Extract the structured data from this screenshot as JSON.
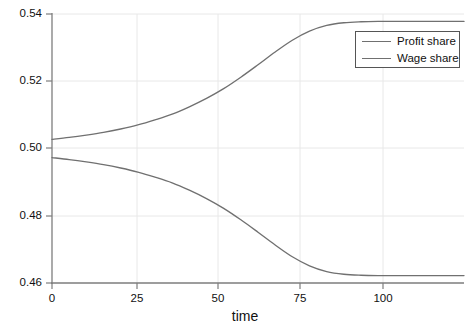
{
  "chart_data": {
    "type": "line",
    "title": "",
    "subtitle": "",
    "xlabel": "time",
    "ylabel": "",
    "xlim": [
      0,
      120
    ],
    "ylim": [
      0.46,
      0.54
    ],
    "grid": true,
    "grid_color": "#e8e8e8",
    "axis_color": "#808080",
    "legend_position": "top-right",
    "xticks": [
      0,
      25,
      50,
      75,
      100
    ],
    "xtick_labels": [
      "0",
      "25",
      "50",
      "75",
      "100"
    ],
    "yticks": [
      0.46,
      0.48,
      0.5,
      0.52,
      0.54
    ],
    "ytick_labels": [
      "0.46",
      "0.48",
      "0.50",
      "0.52",
      "0.54"
    ],
    "x": [
      0,
      5,
      10,
      15,
      20,
      25,
      30,
      35,
      40,
      45,
      50,
      55,
      60,
      65,
      70,
      75,
      80,
      85,
      90,
      95,
      100,
      105,
      110,
      115,
      120
    ],
    "series": [
      {
        "name": "Profit share",
        "color": "#707070",
        "values": [
          0.5027,
          0.5033,
          0.504,
          0.5048,
          0.5058,
          0.507,
          0.5085,
          0.5102,
          0.5124,
          0.5149,
          0.5178,
          0.5212,
          0.5249,
          0.5287,
          0.5322,
          0.5349,
          0.5366,
          0.5374,
          0.5377,
          0.5378,
          0.5378,
          0.5378,
          0.5378,
          0.5378,
          0.5378
        ]
      },
      {
        "name": "Wage share",
        "color": "#707070",
        "values": [
          0.4973,
          0.4967,
          0.496,
          0.4952,
          0.4942,
          0.493,
          0.4915,
          0.4898,
          0.4876,
          0.4851,
          0.4822,
          0.4788,
          0.4751,
          0.4713,
          0.4678,
          0.4651,
          0.4634,
          0.4626,
          0.4623,
          0.4622,
          0.4622,
          0.4622,
          0.4622,
          0.4622,
          0.4622
        ]
      }
    ]
  }
}
